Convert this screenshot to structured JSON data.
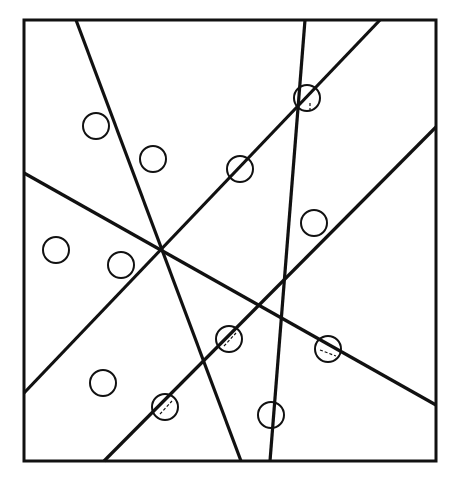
{
  "diagram": {
    "width": 458,
    "height": 480,
    "background": "#ffffff",
    "stroke_color": "#111111",
    "frame": {
      "x": 24,
      "y": 20,
      "width": 412,
      "height": 441,
      "stroke_width": 3
    },
    "lines": [
      {
        "id": "line-a",
        "x1": 76,
        "y1": 20,
        "x2": 241,
        "y2": 461,
        "stroke_width": 3.2
      },
      {
        "id": "line-b",
        "x1": 305,
        "y1": 20,
        "x2": 270,
        "y2": 461,
        "stroke_width": 3.2
      },
      {
        "id": "line-c",
        "x1": 380,
        "y1": 20,
        "x2": 24,
        "y2": 393,
        "stroke_width": 3.2
      },
      {
        "id": "line-d",
        "x1": 24,
        "y1": 173,
        "x2": 436,
        "y2": 405,
        "stroke_width": 3.2
      },
      {
        "id": "line-e",
        "x1": 436,
        "y1": 127,
        "x2": 104,
        "y2": 461,
        "stroke_width": 3.2
      }
    ],
    "circles": [
      {
        "cx": 96,
        "cy": 126,
        "r": 13
      },
      {
        "cx": 153,
        "cy": 159,
        "r": 13
      },
      {
        "cx": 240,
        "cy": 169,
        "r": 13
      },
      {
        "cx": 307,
        "cy": 98,
        "r": 13
      },
      {
        "cx": 314,
        "cy": 223,
        "r": 13
      },
      {
        "cx": 56,
        "cy": 250,
        "r": 13
      },
      {
        "cx": 121,
        "cy": 265,
        "r": 13
      },
      {
        "cx": 229,
        "cy": 339,
        "r": 13
      },
      {
        "cx": 328,
        "cy": 349,
        "r": 13
      },
      {
        "cx": 103,
        "cy": 383,
        "r": 13
      },
      {
        "cx": 165,
        "cy": 407,
        "r": 13
      },
      {
        "cx": 271,
        "cy": 415,
        "r": 13
      }
    ],
    "circle_stroke_width": 2,
    "dashed_marks": [
      {
        "x1": 160,
        "y1": 414,
        "x2": 172,
        "y2": 401
      },
      {
        "x1": 224,
        "y1": 346,
        "x2": 236,
        "y2": 333
      },
      {
        "x1": 320,
        "y1": 350,
        "x2": 336,
        "y2": 356
      },
      {
        "x1": 310,
        "y1": 103,
        "x2": 310,
        "y2": 111
      }
    ]
  }
}
